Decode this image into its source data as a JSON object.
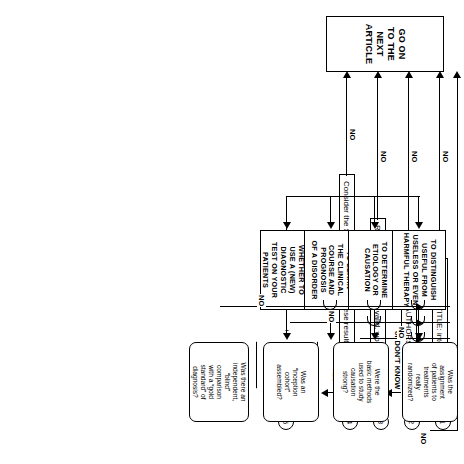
{
  "diagram": {
    "orientation": "rotated-90",
    "terminal": {
      "label": "GO ON TO THE NEXT ARTICLE",
      "lines": [
        "GO ON",
        "TO THE",
        "NEXT",
        "ARTICLE"
      ]
    },
    "screening_steps": [
      {
        "number": "1",
        "text": "Look at the TITLE: interesting or useful?",
        "yes_label": "YES",
        "no_label": "NO"
      },
      {
        "number": "2",
        "text": "Review the AUTHORS:  good track record?",
        "yes_label": "YES",
        "yes_alt_label": "or DON'T KNOW",
        "no_label": "NO"
      },
      {
        "number": "3",
        "text": "Read the SUMMARY:  if valid, would these results be useful?",
        "yes_label": "YES",
        "no_label": "NO"
      },
      {
        "number": "4",
        "text": "Consider the SITE:  if valid, would these results apply in your practice?",
        "yes_label": "YES",
        "no_label": "NO"
      }
    ],
    "intent_decision": {
      "number": "5",
      "lines": [
        "WHAT",
        "IS YOUR",
        "INTENT?"
      ],
      "yes_label": "YES"
    },
    "intents": [
      {
        "id": "diagnosis",
        "lines": [
          "TO FIND OUT",
          "WHETHER TO",
          "USE A (NEW)",
          "DIAGNOSTIC",
          "TEST ON YOUR",
          "PATIENTS"
        ]
      },
      {
        "id": "prognosis",
        "lines": [
          "TO LEARN",
          "THE CLINICAL",
          "COURSE AND",
          "PROGNOSIS",
          "OF A DISORDER"
        ]
      },
      {
        "id": "etiology",
        "lines": [
          "TO DETERMINE",
          "ETIOLOGY OR",
          "CAUSATION"
        ]
      },
      {
        "id": "therapy",
        "lines": [
          "TO DISTINGUISH",
          "USEFUL FROM",
          "USELESS OR EVEN",
          "HARMFUL THERAPY"
        ]
      }
    ],
    "guide_questions": [
      {
        "id": "diagnosis-question",
        "lines": [
          "Was there an",
          "independent,",
          "“blind”",
          "comparison",
          "with a “gold",
          "standard” of",
          "diagnosis?"
        ],
        "no_label": "NO"
      },
      {
        "id": "prognosis-question",
        "lines": [
          "Was an",
          "“inception",
          "cohort”",
          "assembled?"
        ],
        "no_label": "NO"
      },
      {
        "id": "etiology-question",
        "lines": [
          "Were the",
          "basic methods",
          "used to study",
          "causation",
          "strong?"
        ],
        "no_label": "NO"
      },
      {
        "id": "therapy-question",
        "lines": [
          "Was the",
          "assignment",
          "of patients to",
          "treatments",
          "really",
          "randomized?"
        ],
        "no_label": "NO"
      }
    ]
  }
}
